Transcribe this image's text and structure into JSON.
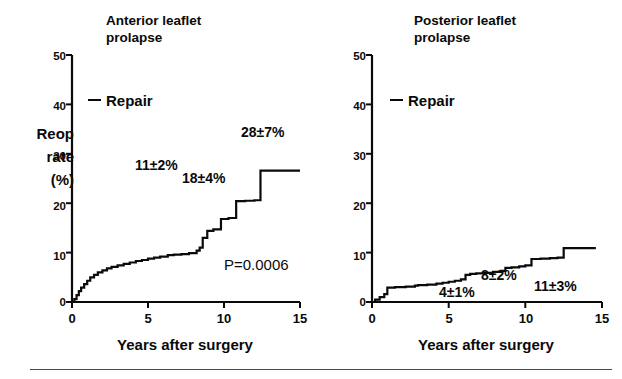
{
  "figure": {
    "panels": [
      {
        "id": "anterior",
        "title": "Anterior leaflet\nprolapse",
        "legend_label": "Repair",
        "ylabel": "Reop\nrate\n(%)",
        "xlabel": "Years after surgery",
        "pvalue": "P=0.0006",
        "annotations": [
          "11±2%",
          "18±4%",
          "28±7%"
        ],
        "yticks": [
          "0",
          "10",
          "20",
          "30",
          "40",
          "50"
        ],
        "xticks": [
          "0",
          "5",
          "10",
          "15"
        ]
      },
      {
        "id": "posterior",
        "title": "Posterior leaflet\nprolapse",
        "legend_label": "Repair",
        "xlabel": "Years after surgery",
        "annotations": [
          "4±1%",
          "8±2%",
          "11±3%"
        ],
        "yticks": [
          "0",
          "10",
          "20",
          "30",
          "40",
          "50"
        ],
        "xticks": [
          "0",
          "5",
          "10",
          "15"
        ]
      }
    ]
  },
  "chart_data": [
    {
      "type": "line",
      "title": "Anterior leaflet prolapse",
      "subtitle": "",
      "xlabel": "Years after surgery",
      "ylabel": "Reop rate (%)",
      "xlim": [
        0,
        15
      ],
      "ylim": [
        0,
        50
      ],
      "xticks": [
        0,
        5,
        10,
        15
      ],
      "yticks": [
        0,
        10,
        20,
        30,
        40,
        50
      ],
      "grid": false,
      "legend": [
        "Repair"
      ],
      "legend_position": "upper-left-inside",
      "style": "step",
      "annotations": [
        {
          "text": "11±2%",
          "x": 5.0,
          "y": 22.0
        },
        {
          "text": "18±4%",
          "x": 8.0,
          "y": 28.5
        },
        {
          "text": "28±7%",
          "x": 11.6,
          "y": 35.5
        },
        {
          "text": "P=0.0006",
          "x": 10.6,
          "y": 7.5
        }
      ],
      "series": [
        {
          "name": "Repair",
          "x": [
            0,
            0.15,
            0.3,
            0.45,
            0.6,
            0.8,
            1.0,
            1.2,
            1.45,
            1.7,
            2.0,
            2.3,
            2.6,
            3.0,
            3.4,
            3.8,
            4.2,
            4.6,
            5.0,
            5.4,
            5.8,
            6.3,
            6.7,
            7.2,
            7.7,
            8.2,
            8.4,
            8.6,
            8.9,
            9.3,
            9.8,
            10.3,
            10.8,
            11.4,
            12.0,
            12.4,
            15.0
          ],
          "y": [
            0,
            0.6,
            1.4,
            2.2,
            2.9,
            3.6,
            4.3,
            5.0,
            5.5,
            6.0,
            6.4,
            6.8,
            7.1,
            7.4,
            7.7,
            8.0,
            8.3,
            8.5,
            8.8,
            9.0,
            9.2,
            9.5,
            9.6,
            9.7,
            9.9,
            10.4,
            11.0,
            13.0,
            14.4,
            14.7,
            16.8,
            17.0,
            20.4,
            20.5,
            20.6,
            26.6,
            26.6
          ]
        }
      ]
    },
    {
      "type": "line",
      "title": "Posterior leaflet prolapse",
      "subtitle": "",
      "xlabel": "Years after surgery",
      "ylabel": "",
      "xlim": [
        0,
        15
      ],
      "ylim": [
        0,
        50
      ],
      "xticks": [
        0,
        5,
        10,
        15
      ],
      "yticks": [
        0,
        10,
        20,
        30,
        40,
        50
      ],
      "grid": false,
      "legend": [
        "Repair"
      ],
      "legend_position": "upper-left-inside",
      "style": "step",
      "annotations": [
        {
          "text": "4±1%",
          "x": 5.6,
          "y": 1.8
        },
        {
          "text": "8±2%",
          "x": 8.1,
          "y": 4.6
        },
        {
          "text": "11±3%",
          "x": 11.4,
          "y": 3.4
        }
      ],
      "series": [
        {
          "name": "Repair",
          "x": [
            0,
            0.2,
            0.5,
            0.8,
            1.0,
            1.5,
            2.2,
            2.8,
            3.0,
            3.6,
            4.2,
            4.6,
            5.0,
            5.4,
            5.8,
            6.1,
            6.4,
            6.8,
            7.3,
            7.9,
            8.4,
            8.7,
            9.1,
            9.6,
            10.0,
            10.4,
            11.0,
            11.6,
            12.1,
            12.5,
            14.6
          ],
          "y": [
            0,
            0.5,
            1.0,
            1.6,
            2.9,
            3.0,
            3.1,
            3.3,
            3.4,
            3.5,
            3.7,
            3.9,
            4.1,
            4.3,
            4.6,
            5.5,
            5.7,
            5.8,
            5.9,
            6.1,
            6.3,
            6.9,
            7.0,
            7.2,
            7.4,
            8.7,
            8.8,
            8.9,
            9.0,
            10.9,
            10.9
          ]
        }
      ]
    }
  ]
}
